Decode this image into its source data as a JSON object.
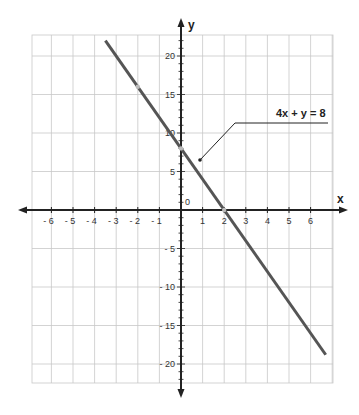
{
  "chart_data": {
    "type": "line",
    "title": "",
    "xlabel": "x",
    "ylabel": "y",
    "origin_label": "0",
    "xlim": [
      -7,
      7
    ],
    "ylim": [
      -22,
      23
    ],
    "grid": true,
    "x_ticks": [
      -6,
      -5,
      -4,
      -3,
      -2,
      -1,
      1,
      2,
      3,
      4,
      5,
      6
    ],
    "x_tick_labels": [
      "- 6",
      "- 5",
      "- 4",
      "- 3",
      "- 2",
      "- 1",
      "1",
      "2",
      "3",
      "4",
      "5",
      "6"
    ],
    "y_ticks": [
      20,
      15,
      10,
      5,
      -5,
      -10,
      -15,
      -20
    ],
    "y_tick_labels": [
      "20",
      "15",
      "10",
      "5",
      "- 5",
      "- 10",
      "- 15",
      "- 20"
    ],
    "series": [
      {
        "name": "4x + y = 8",
        "equation": "y = -4x + 8",
        "x": [
          -3.5,
          -2,
          0,
          2,
          6.7
        ],
        "y": [
          22,
          16,
          8,
          0,
          -18.8
        ],
        "color": "#555555",
        "highlighted_points": [
          [
            -2,
            16
          ],
          [
            0,
            8
          ],
          [
            2,
            0
          ]
        ]
      }
    ],
    "annotations": [
      {
        "text": "4x + y = 8",
        "points_to": [
          0.8,
          6.5
        ]
      }
    ],
    "legend": "none"
  },
  "colors": {
    "grid": "#c8c8c8",
    "axis": "#222222",
    "line": "#555555",
    "point": "#bbbbbb"
  }
}
